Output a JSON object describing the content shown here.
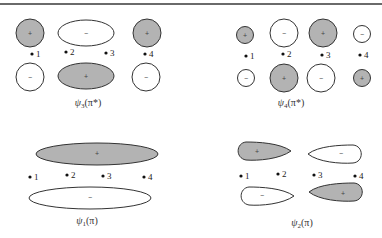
{
  "diagram": {
    "atom_labels": [
      "1",
      "2",
      "3",
      "4"
    ],
    "panels": [
      {
        "id": "psi3",
        "label_symbol": "ψ",
        "label_sub": "3",
        "label_arg": "(π*)",
        "top_signs": [
          "+",
          "−",
          "+"
        ],
        "bottom_signs": [
          "−",
          "+",
          "−"
        ]
      },
      {
        "id": "psi4",
        "label_symbol": "ψ",
        "label_sub": "4",
        "label_arg": "(π*)",
        "top_signs": [
          "+",
          "−",
          "+",
          "−"
        ],
        "bottom_signs": [
          "−",
          "+",
          "−",
          "+"
        ]
      },
      {
        "id": "psi1",
        "label_symbol": "ψ",
        "label_sub": "1",
        "label_arg": "(π)",
        "top_signs": [
          "+"
        ],
        "bottom_signs": [
          "−"
        ]
      },
      {
        "id": "psi2",
        "label_symbol": "ψ",
        "label_sub": "2",
        "label_arg": "(π)",
        "top_signs": [
          "+",
          "−"
        ],
        "bottom_signs": [
          "−",
          "+"
        ]
      }
    ],
    "colors": {
      "shaded_lobe": "#b3b3b3",
      "white_lobe": "#ffffff",
      "outline": "#333333"
    }
  }
}
